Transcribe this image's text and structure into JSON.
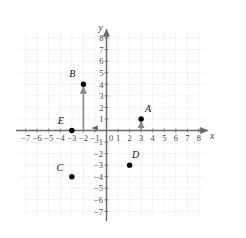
{
  "chart_data": {
    "type": "scatter",
    "title": "",
    "xlabel": "x",
    "ylabel": "y",
    "xlim": [
      -7.5,
      8.5
    ],
    "ylim": [
      -7.5,
      8.5
    ],
    "grid": true,
    "legend": "none",
    "x_ticks": [
      -7,
      -6,
      -5,
      -4,
      -3,
      -2,
      -1,
      0,
      1,
      2,
      3,
      4,
      5,
      6,
      7,
      8
    ],
    "x_tick_labels": [
      "−7",
      "−6",
      "−5",
      "−4",
      "−3",
      "−2",
      "−1",
      "0",
      "1",
      "2",
      "3",
      "4",
      "5",
      "6",
      "7",
      "8"
    ],
    "y_ticks": [
      8,
      7,
      6,
      5,
      4,
      3,
      2,
      1,
      -1,
      -2,
      -3,
      -4,
      -5,
      -6,
      -7
    ],
    "y_tick_labels": [
      "8",
      "7",
      "6",
      "5",
      "4",
      "3",
      "2",
      "1",
      "−1",
      "−2",
      "−3",
      "−4",
      "−5",
      "−6",
      "−7"
    ],
    "origin_label": "0",
    "points": [
      {
        "name": "A",
        "label": "A",
        "x": 3,
        "y": 1,
        "label_dx": 7,
        "label_dy": -7
      },
      {
        "name": "B",
        "label": "B",
        "x": -2,
        "y": 4,
        "label_dx": -11,
        "label_dy": -7
      },
      {
        "name": "C",
        "label": "C",
        "x": -3,
        "y": -4,
        "label_dx": -12,
        "label_dy": -6
      },
      {
        "name": "D",
        "label": "D",
        "x": 2,
        "y": -3,
        "label_dx": 6,
        "label_dy": -7
      },
      {
        "name": "E",
        "label": "E",
        "x": -3,
        "y": 0,
        "label_dx": -11,
        "label_dy": -7
      }
    ],
    "arrows": [
      {
        "name": "arrow-to-A",
        "x": 3,
        "y0": 0,
        "y1": 1
      },
      {
        "name": "arrow-to-B",
        "x": -2,
        "y0": 0,
        "y1": 4
      }
    ]
  },
  "style": {
    "grid_color": "#d8d8d8",
    "axis_color": "#6b6b6b",
    "point_color": "#000000",
    "arrow_color": "#8a8a8a",
    "background": "#ffffff"
  }
}
